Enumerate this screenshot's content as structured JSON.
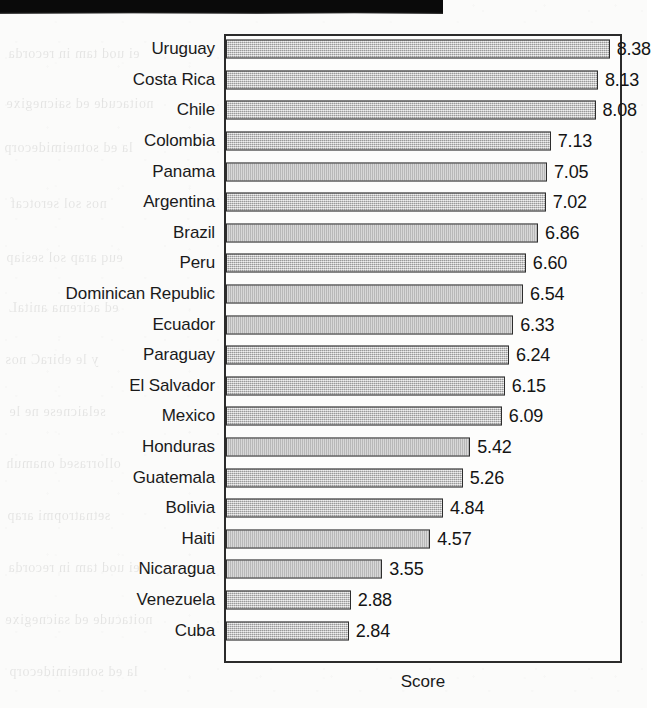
{
  "page": {
    "scan_artifact": "black-scan-bar",
    "bleed_through_lines": [
      "ei uod tam in recorda",
      "noitacude ed saicnegixe",
      "la ed sotneimidecorp",
      "nos sol serotcaf",
      "euq arap sol sesiap",
      "ed acirema anitaL",
      "y le ebiraC nos",
      "selaicnese ne le",
      "ollorrased onamuh",
      "setnatropmi arap"
    ]
  },
  "chart_data": {
    "type": "bar",
    "orientation": "horizontal",
    "title": "",
    "xlabel": "Score",
    "ylabel": "",
    "grid": false,
    "legend": false,
    "xlim": [
      0,
      8.7
    ],
    "value_format": "0.00",
    "bar_color": "#bdbdbd",
    "bar_edge_color": "#2e2e2e",
    "frame_color": "#2b2b2b",
    "categories": [
      "Uruguay",
      "Costa Rica",
      "Chile",
      "Colombia",
      "Panama",
      "Argentina",
      "Brazil",
      "Peru",
      "Dominican Republic",
      "Ecuador",
      "Paraguay",
      "El Salvador",
      "Mexico",
      "Honduras",
      "Guatemala",
      "Bolivia",
      "Haiti",
      "Nicaragua",
      "Venezuela",
      "Cuba"
    ],
    "values": [
      8.38,
      8.13,
      8.08,
      7.13,
      7.05,
      7.02,
      6.86,
      6.6,
      6.54,
      6.33,
      6.24,
      6.15,
      6.09,
      5.42,
      5.26,
      4.84,
      4.57,
      3.55,
      2.88,
      2.84
    ],
    "value_labels": [
      "8.38",
      "8.13",
      "8.08",
      "7.13",
      "7.05",
      "7.02",
      "6.86",
      "6.60",
      "6.54",
      "6.33",
      "6.24",
      "6.15",
      "6.09",
      "5.42",
      "5.26",
      "4.84",
      "4.57",
      "3.55",
      "2.88",
      "2.84"
    ]
  }
}
